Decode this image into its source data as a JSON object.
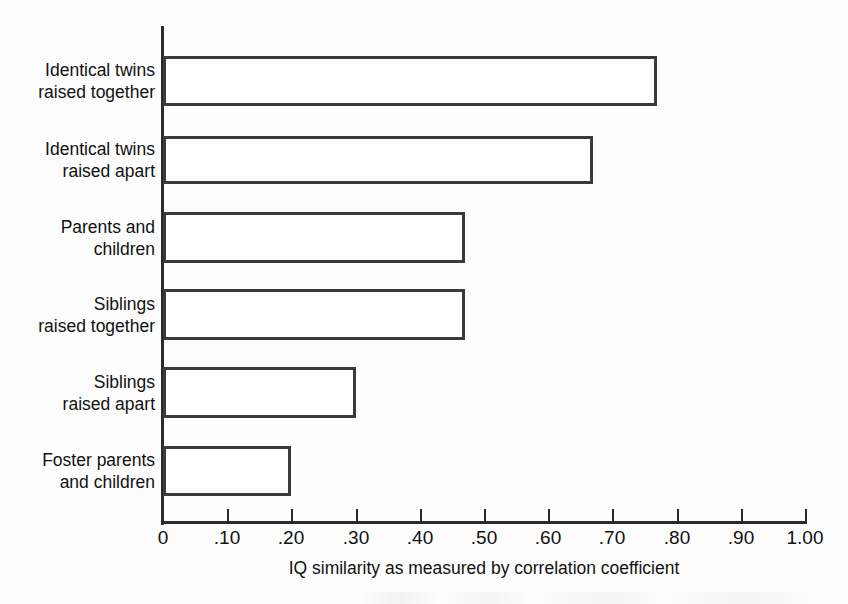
{
  "chart_data": {
    "type": "bar",
    "orientation": "horizontal",
    "title": "",
    "xlabel": "IQ similarity as measured by correlation coefficient",
    "ylabel": "",
    "xlim": [
      0,
      1.0
    ],
    "grid": false,
    "legend": null,
    "categories": [
      "Identical twins\nraised together",
      "Identical twins\nraised apart",
      "Parents and\nchildren",
      "Siblings\nraised together",
      "Siblings\nraised apart",
      "Foster parents\nand children"
    ],
    "values": [
      0.77,
      0.67,
      0.47,
      0.47,
      0.3,
      0.2
    ],
    "xtick_values": [
      0,
      0.1,
      0.2,
      0.3,
      0.4,
      0.5,
      0.6,
      0.7,
      0.8,
      0.9,
      1.0
    ],
    "xtick_labels": [
      "0",
      ".10",
      ".20",
      ".30",
      ".40",
      ".50",
      ".60",
      ".70",
      ".80",
      ".90",
      "1.00"
    ],
    "bar_style": {
      "fill": "#ffffff",
      "edge": "#3a3a3a",
      "edge_width_px": 3
    },
    "axis_color": "#2b2b2b",
    "background": "#fdfdfd"
  },
  "chart": {
    "axis_title": "IQ similarity as measured by correlation coefficient"
  },
  "bars": [
    {
      "label": "Identical twins\nraised together",
      "value": 0.77,
      "top": 56,
      "height": 50
    },
    {
      "label": "Identical twins\nraised apart",
      "value": 0.67,
      "top": 136,
      "height": 48
    },
    {
      "label": "Parents and\nchildren",
      "value": 0.47,
      "top": 212,
      "height": 51
    },
    {
      "label": "Siblings\nraised together",
      "value": 0.47,
      "top": 289,
      "height": 51
    },
    {
      "label": "Siblings\nraised apart",
      "value": 0.3,
      "top": 367,
      "height": 51
    },
    {
      "label": "Foster parents\nand children",
      "value": 0.2,
      "top": 446,
      "height": 50
    }
  ],
  "geometry": {
    "origin_x": 163,
    "px_per_unit": 642
  }
}
